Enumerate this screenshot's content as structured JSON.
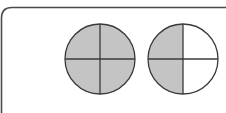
{
  "diagram": {
    "type": "fraction-circles",
    "colors": {
      "shade": "#c4c4c4",
      "stroke": "#3a3a3a",
      "frame": "#4a4a4a",
      "background": "#ffffff"
    },
    "circles": [
      {
        "label": "whole circle shaded",
        "parts": 4,
        "shaded": 4,
        "shaded_quadrants": [
          "top-left",
          "top-right",
          "bottom-left",
          "bottom-right"
        ]
      },
      {
        "label": "left half shaded",
        "parts": 4,
        "shaded": 2,
        "shaded_quadrants": [
          "top-left",
          "bottom-left"
        ]
      }
    ]
  }
}
